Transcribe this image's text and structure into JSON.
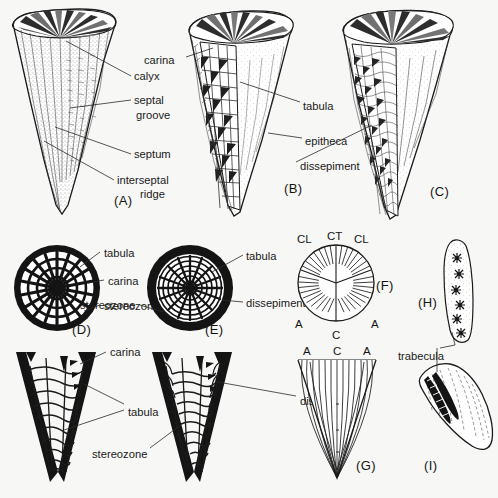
{
  "figure": {
    "background_color": "#f7f7f5",
    "ink_color": "#1b1b1b",
    "panels": [
      {
        "id": "A",
        "caption": "(A)",
        "kind": "solitary-coral-exterior-cutaway"
      },
      {
        "id": "B",
        "caption": "(B)",
        "kind": "solitary-coral-tabulate-cutaway"
      },
      {
        "id": "C",
        "caption": "(C)",
        "kind": "solitary-coral-dissepimental-cutaway"
      },
      {
        "id": "D",
        "caption": "(D)",
        "kind": "transverse-section-tabulate"
      },
      {
        "id": "E",
        "caption": "(E)",
        "kind": "transverse-section-dissepimental"
      },
      {
        "id": "F",
        "caption": "(F)",
        "kind": "septal-insertion-diagram-transverse"
      },
      {
        "id": "G",
        "caption": "(G)",
        "kind": "septal-insertion-diagram-longitudinal"
      },
      {
        "id": "H",
        "caption": "(H)",
        "kind": "septum-trabeculae-surface"
      },
      {
        "id": "I",
        "caption": "(I)",
        "kind": "septum-trabeculae-section"
      }
    ],
    "labels": {
      "carina": "carina",
      "calyx": "calyx",
      "septal_groove_line1": "septal",
      "septal_groove_line2": "groove",
      "septum": "septum",
      "interseptal_ridge_line1": "interseptal",
      "interseptal_ridge_line2": "ridge",
      "tabula": "tabula",
      "epitheca": "epitheca",
      "dissepiment": "dissepiment",
      "stereozone": "stereozone",
      "trabecula": "trabecula"
    },
    "septal_codes": {
      "cardinal": "C",
      "alar": "A",
      "counter": "CT",
      "counter_lateral": "CL"
    },
    "label_instances": [
      {
        "text": "carina",
        "panel": "B",
        "x": 144,
        "y": 60
      },
      {
        "text": "calyx",
        "panel": "A",
        "x": 134,
        "y": 80
      },
      {
        "text": "septal",
        "panel": "A",
        "x": 134,
        "y": 104
      },
      {
        "text": "groove",
        "panel": "A",
        "x": 136,
        "y": 119
      },
      {
        "text": "septum",
        "panel": "A",
        "x": 134,
        "y": 157
      },
      {
        "text": "interseptal",
        "panel": "A",
        "x": 117,
        "y": 183
      },
      {
        "text": "ridge",
        "panel": "A",
        "x": 140,
        "y": 197
      },
      {
        "text": "tabula",
        "panel": "B",
        "x": 303,
        "y": 106
      },
      {
        "text": "epitheca",
        "panel": "B",
        "x": 305,
        "y": 141
      },
      {
        "text": "dissepiment",
        "panel": "C",
        "x": 300,
        "y": 166
      },
      {
        "text": "tabula",
        "panel": "D",
        "x": 104,
        "y": 253
      },
      {
        "text": "carina",
        "panel": "D",
        "x": 108,
        "y": 282
      },
      {
        "text": "stereozone",
        "panel": "D",
        "x": 104,
        "y": 307
      },
      {
        "text": "tabula",
        "panel": "E",
        "x": 246,
        "y": 256
      },
      {
        "text": "dissepiment",
        "panel": "E",
        "x": 246,
        "y": 306
      },
      {
        "text": "carina",
        "panel": "bottom-left",
        "x": 110,
        "y": 352
      },
      {
        "text": "tabula",
        "panel": "bottom-left",
        "x": 128,
        "y": 412
      },
      {
        "text": "stereozone",
        "panel": "bottom-left",
        "x": 96,
        "y": 453
      },
      {
        "text": "dissepiment",
        "panel": "bottom-mid",
        "x": 300,
        "y": 401
      },
      {
        "text": "trabecula",
        "panel": "I",
        "x": 398,
        "y": 356
      }
    ],
    "panel_f": {
      "caption": "(F)",
      "top_labels": [
        "CL",
        "CT",
        "CL"
      ],
      "side_labels": [
        "A",
        "A"
      ],
      "bottom_label": "C",
      "septa_count": 34
    },
    "panel_g": {
      "caption": "(G)",
      "top_labels": [
        "A",
        "C",
        "A"
      ],
      "septa_count": 22
    },
    "panel_h": {
      "caption": "(H)",
      "trabeculae_count": 6
    },
    "panel_i": {
      "caption": "(I)",
      "trabeculae_rows": 2
    }
  }
}
